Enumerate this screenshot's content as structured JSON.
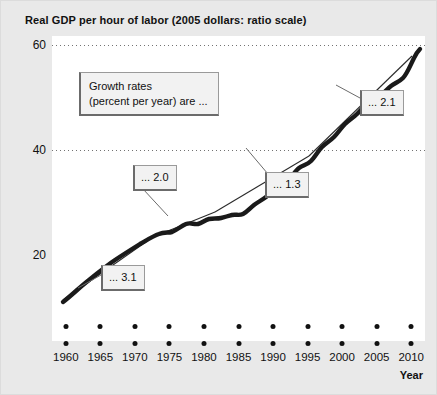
{
  "chart_data": {
    "type": "line",
    "title": "Real GDP per hour of labor (2005 dollars: ratio scale)",
    "xlabel": "Year",
    "ylabel": "",
    "scale": "ratio (log) scale",
    "grid": "horizontal dotted gridlines at 60 and 40",
    "legend_position": "inside upper-left callout box",
    "xlim": [
      1958,
      2012
    ],
    "ylim": [
      14,
      66
    ],
    "ytick_labels": [
      "60",
      "40",
      "20"
    ],
    "ytick_values": [
      60,
      40,
      20
    ],
    "xtick_labels": [
      "1960",
      "1965",
      "1970",
      "1975",
      "1980",
      "1985",
      "1990",
      "1995",
      "2000",
      "2005",
      "2010"
    ],
    "xtick_values": [
      1960,
      1965,
      1970,
      1975,
      1980,
      1985,
      1990,
      1995,
      2000,
      2005,
      2010
    ],
    "series": [
      {
        "name": "Real GDP per hour of labor",
        "style": "thick black line",
        "x": [
          1960,
          1962,
          1964,
          1966,
          1968,
          1970,
          1972,
          1974,
          1976,
          1978,
          1980,
          1982,
          1984,
          1986,
          1988,
          1990,
          1992,
          1994,
          1996,
          1998,
          2000,
          2002,
          2004,
          2006,
          2008,
          2010
        ],
        "values": [
          16.4,
          17.6,
          19.0,
          20.4,
          21.7,
          22.6,
          24.0,
          24.3,
          25.6,
          26.4,
          26.6,
          27.3,
          29.0,
          30.2,
          31.1,
          32.2,
          34.0,
          35.1,
          36.8,
          39.3,
          41.6,
          44.3,
          47.2,
          49.3,
          51.6,
          57.2
        ]
      },
      {
        "name": "Trend segments",
        "style": "thin straight trend lines",
        "segments": [
          {
            "label": "... 3.1",
            "growth_rate": 3.1,
            "from_year": 1960,
            "to_year": 1973
          },
          {
            "label": "... 2.0",
            "growth_rate": 2.0,
            "from_year": 1973,
            "to_year": 1982
          },
          {
            "label": "... 1.3",
            "growth_rate": 1.3,
            "from_year": 1982,
            "to_year": 1995
          },
          {
            "label": "... 2.1",
            "growth_rate": 2.1,
            "from_year": 1995,
            "to_year": 2010
          }
        ]
      }
    ],
    "annotations": [
      {
        "id": "legend",
        "line1": "Growth rates",
        "line2": "(percent per year) are ..."
      },
      {
        "id": "rate-31",
        "text": "... 3.1"
      },
      {
        "id": "rate-20",
        "text": "... 2.0"
      },
      {
        "id": "rate-13",
        "text": "... 1.3"
      },
      {
        "id": "rate-21",
        "text": "... 2.1"
      }
    ],
    "colors": {
      "line": "#1a1a1a",
      "trend": "#2b2b2b",
      "gridline": "#5a5a5a",
      "plot_background": "#ffffff",
      "figure_background": "#e9e9e9",
      "callout_background": "#f2f2f2",
      "callout_border": "#6b6b6b",
      "text": "#111111"
    }
  }
}
